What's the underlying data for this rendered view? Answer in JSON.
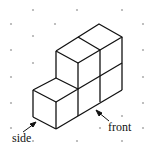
{
  "diagram": {
    "type": "isometric cube drawing on dot paper",
    "labels": {
      "side": "side",
      "front": "front"
    },
    "colors": {
      "background": "#ffffff",
      "dots": "#b0b0b0",
      "lines": "#111111"
    },
    "cube_count": 4
  }
}
